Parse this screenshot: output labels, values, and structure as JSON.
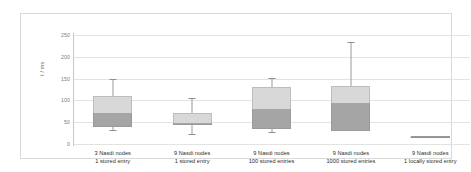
{
  "chart_data": {
    "type": "box",
    "title": "",
    "xlabel": "",
    "ylabel": "t / ms",
    "ylim": [
      0,
      250
    ],
    "ytick_values": [
      250,
      200,
      150,
      100,
      50,
      0
    ],
    "ytick_labels": [
      "250",
      "200",
      "150",
      "100",
      "50",
      "0"
    ],
    "grid": true,
    "legend": "none",
    "categories": [
      "3 Nasdi nodes\n1 stored entry",
      "9 Nasdi nodes\n1 stored entry",
      "9 Nasdi nodes\n100 stored entries",
      "9 Nasdi nodes\n1000 stored entries",
      "9 Nasdi nodes\n1 locally stored entry"
    ],
    "category_lines": [
      [
        "3 Nasdi nodes",
        "1 stored entry"
      ],
      [
        "9 Nasdi nodes",
        "1 stored entry"
      ],
      [
        "9 Nasdi nodes",
        "100 stored entries"
      ],
      [
        "9 Nasdi nodes",
        "1000 stored entries"
      ],
      [
        "9 Nasdi nodes",
        "1 locally stored entry"
      ]
    ],
    "boxes": [
      {
        "label": "3 Nasdi nodes, 1 stored entry",
        "min": 32,
        "q1": 40,
        "median": 70,
        "q3": 110,
        "max": 150
      },
      {
        "label": "9 Nasdi nodes, 1 stored entry",
        "min": 22,
        "q1": 43,
        "median": 48,
        "q3": 72,
        "max": 105
      },
      {
        "label": "9 Nasdi nodes, 100 stored entries",
        "min": 27,
        "q1": 34,
        "median": 80,
        "q3": 131,
        "max": 152
      },
      {
        "label": "9 Nasdi nodes, 1000 stored entries",
        "min": 30,
        "q1": 30,
        "median": 94,
        "q3": 132,
        "max": 233
      },
      {
        "label": "9 Nasdi nodes, 1 locally stored entry",
        "min": 15,
        "q1": 15,
        "median": 15,
        "q3": 15,
        "max": 15
      }
    ],
    "colors": {
      "box_upper": "#d8d8d8",
      "box_lower": "#a5a5a5",
      "whisker": "#9a9a9a",
      "gridline": "#e3e3e3",
      "axis": "#c6c6c6",
      "tick_text": "#7b7b7b",
      "category_text": "#2b2b2b",
      "frame": "#d9d9d9",
      "background": "#ffffff"
    }
  }
}
